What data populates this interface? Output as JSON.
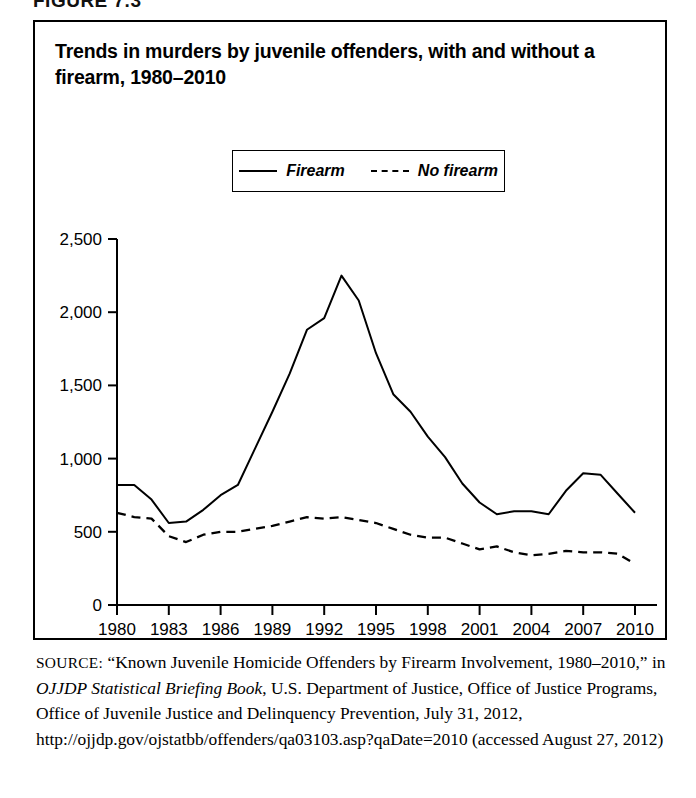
{
  "figure": {
    "tag": "FIGURE 7.3",
    "title": "Trends in murders by juvenile offenders, with and without a firearm, 1980–2010"
  },
  "legend": {
    "items": [
      {
        "label": "Firearm",
        "style": "solid"
      },
      {
        "label": "No firearm",
        "style": "dashed"
      }
    ]
  },
  "source": {
    "kicker": "SOURCE:",
    "text_before_italic": " “Known Juvenile Homicide Offenders by Firearm Involvement, 1980–2010,” in ",
    "italic_title": "OJJDP Statistical Briefing Book",
    "text_after_italic": ", U.S. Department of Justice, Office of Justice Programs, Office of Juvenile Justice and Delinquency Prevention, July 31, 2012, http://ojjdp.gov/ojstatbb/offenders/qa03103.asp?qaDate=2010 (accessed August 27, 2012)"
  },
  "chart_data": {
    "type": "line",
    "title": "Trends in murders by juvenile offenders, with and without a firearm, 1980–2010",
    "xlabel": "",
    "ylabel": "",
    "xlim": [
      1980,
      2010
    ],
    "ylim": [
      0,
      2500
    ],
    "ytick_labels": [
      "0",
      "500",
      "1,000",
      "1,500",
      "2,000",
      "2,500"
    ],
    "ytick_values": [
      0,
      500,
      1000,
      1500,
      2000,
      2500
    ],
    "xtick_labels": [
      "1980",
      "1983",
      "1986",
      "1989",
      "1992",
      "1995",
      "1998",
      "2001",
      "2004",
      "2007",
      "2010"
    ],
    "xtick_values": [
      1980,
      1983,
      1986,
      1989,
      1992,
      1995,
      1998,
      2001,
      2004,
      2007,
      2010
    ],
    "grid": false,
    "legend_position": "top-center",
    "x": [
      1980,
      1981,
      1982,
      1983,
      1984,
      1985,
      1986,
      1987,
      1988,
      1989,
      1990,
      1991,
      1992,
      1993,
      1994,
      1995,
      1996,
      1997,
      1998,
      1999,
      2000,
      2001,
      2002,
      2003,
      2004,
      2005,
      2006,
      2007,
      2008,
      2009,
      2010
    ],
    "series": [
      {
        "name": "Firearm",
        "style": "solid",
        "values": [
          820,
          820,
          720,
          560,
          570,
          650,
          750,
          820,
          1070,
          1320,
          1580,
          1880,
          1960,
          2250,
          2080,
          1720,
          1440,
          1320,
          1150,
          1010,
          830,
          700,
          620,
          640,
          640,
          620,
          780,
          900,
          890,
          760,
          630
        ]
      },
      {
        "name": "No firearm",
        "style": "dashed",
        "values": [
          630,
          600,
          590,
          470,
          430,
          480,
          500,
          500,
          520,
          540,
          570,
          600,
          590,
          600,
          580,
          560,
          520,
          480,
          460,
          460,
          420,
          380,
          400,
          360,
          340,
          350,
          370,
          360,
          360,
          350,
          280
        ]
      }
    ],
    "annotations": {
      "peak_year": 1993,
      "peak_value": 2250
    }
  }
}
